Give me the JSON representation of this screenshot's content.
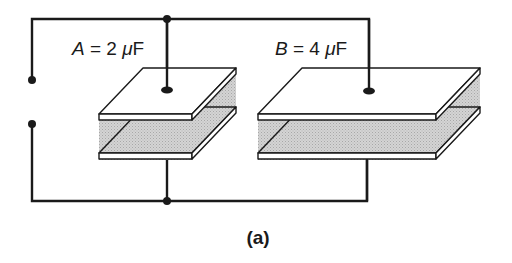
{
  "figure": {
    "caption": "(a)",
    "capacitors": [
      {
        "id": "A",
        "label_var": "A",
        "label_rest": " = 2 ",
        "label_unit_mu": "μ",
        "label_unit": "F",
        "value": 2,
        "unit": "μF"
      },
      {
        "id": "B",
        "label_var": "B",
        "label_rest": " = 4 ",
        "label_unit_mu": "μ",
        "label_unit": "F",
        "value": 4,
        "unit": "μF"
      }
    ],
    "connection": "parallel",
    "colors": {
      "wire": "#1a1a1a",
      "plate_face": "#ffffff",
      "dielectric": "#c9c9c9"
    }
  }
}
